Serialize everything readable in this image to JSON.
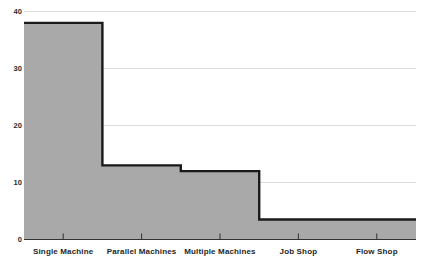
{
  "chart_data": {
    "type": "area",
    "title": "",
    "subtitle": "",
    "xlabel": "",
    "ylabel": "",
    "categories": [
      "Single Machine",
      "Parallel Machines",
      "Multiple Machines",
      "Job Shop",
      "Flow Shop"
    ],
    "values": [
      38,
      13,
      12,
      3.5,
      3.5
    ],
    "series": [
      {
        "name": "Count",
        "values": [
          38,
          13,
          12,
          3.5,
          3.5
        ]
      }
    ],
    "ylim": [
      0,
      40
    ],
    "yticks": [
      0,
      10,
      20,
      30,
      40
    ],
    "ytick_labels": [
      "0",
      "10",
      "20",
      "30",
      "40"
    ],
    "grid": true,
    "grid_axis": "y",
    "legend": false,
    "legend_position": "none",
    "step_style": "step-post",
    "colors": {
      "fill": "#a9a9a9",
      "line": "#1a1a1a",
      "grid": "#d2d2d2",
      "axis": "#333333",
      "text": "#1f1f1f",
      "background": "#ffffff"
    }
  },
  "axes": {
    "y_labels": [
      "40",
      "30",
      "20",
      "10",
      "0"
    ],
    "x_labels": [
      "Single Machine",
      "Parallel Machines",
      "Multiple Machines",
      "Job Shop",
      "Flow Shop"
    ]
  }
}
